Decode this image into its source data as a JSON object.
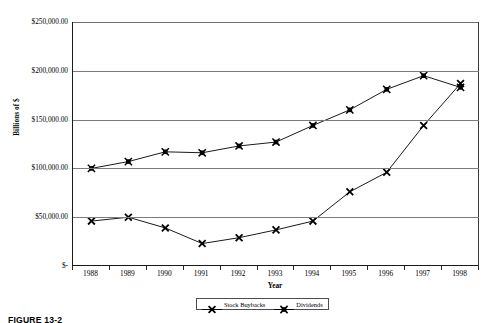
{
  "figure": {
    "caption": "FIGURE 13-2"
  },
  "chart_data": {
    "type": "line",
    "title": "",
    "xlabel": "Year",
    "ylabel": "Billions of $",
    "categories": [
      "1988",
      "1989",
      "1990",
      "1991",
      "1992",
      "1993",
      "1994",
      "1995",
      "1996",
      "1997",
      "1998"
    ],
    "ylim": [
      0,
      250000
    ],
    "ytick_values": [
      0,
      50000,
      100000,
      150000,
      200000,
      250000
    ],
    "ytick_labels": [
      "$-",
      "$50,000.00",
      "$100,000.00",
      "$150,000.00",
      "$200,000.00",
      "$250,000.00"
    ],
    "grid": true,
    "legend_position": "bottom",
    "series": [
      {
        "name": "Stock Buybacks",
        "marker": "x",
        "color": "#000000",
        "values": [
          46000,
          50000,
          39000,
          23000,
          29000,
          37000,
          46000,
          76000,
          96000,
          144000,
          187000
        ]
      },
      {
        "name": "Dividends",
        "marker": "square",
        "color": "#000000",
        "values": [
          100000,
          107000,
          117000,
          116000,
          123000,
          127000,
          144000,
          160000,
          181000,
          195000,
          183000
        ]
      }
    ]
  }
}
